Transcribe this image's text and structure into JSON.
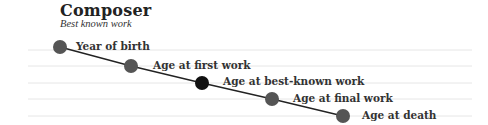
{
  "header": {
    "title": "Composer",
    "subtitle": "Best known work"
  },
  "legend": {
    "items": [
      {
        "label": "Year of birth",
        "color": "#555555"
      },
      {
        "label": "Age at first work",
        "color": "#555555"
      },
      {
        "label": "Age at best-known work",
        "color": "#111111"
      },
      {
        "label": "Age at final work",
        "color": "#555555"
      },
      {
        "label": "Age at death",
        "color": "#555555"
      }
    ]
  },
  "colors": {
    "gridline": "#e6e6e6",
    "connector": "#222222",
    "dot": "#555555",
    "highlight": "#111111"
  }
}
